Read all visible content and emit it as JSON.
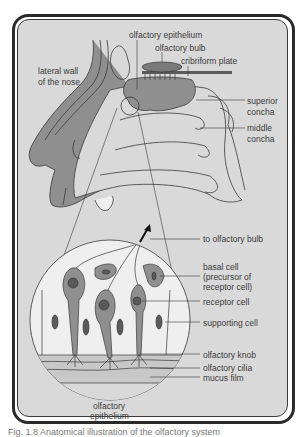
{
  "figure": {
    "frame_background": "#d9d9d9",
    "tissue_color": "#8f8f8f",
    "light_tissue_color": "#efefef",
    "line_color": "#3a3a3a",
    "caption": "Fig. 1.8 Anatomical illustration of the olfactory system"
  },
  "labels": {
    "olfactory_epithelium_top": "olfactory epithelium",
    "olfactory_bulb": "olfactory bulb",
    "cribriform_plate": "cribriform plate",
    "lateral_wall_line1": "lateral wall",
    "lateral_wall_line2": "of the nose",
    "superior_concha_line1": "superior",
    "superior_concha_line2": "concha",
    "middle_concha_line1": "middle",
    "middle_concha_line2": "concha",
    "to_olfactory_bulb": "to olfactory bulb",
    "basal_cell_line1": "basal cell",
    "basal_cell_line2": "(precursor of",
    "basal_cell_line3": "receptor cell)",
    "receptor_cell": "receptor cell",
    "supporting_cell": "supporting cell",
    "olfactory_knob": "olfactory knob",
    "olfactory_cilia": "olfactory cilia",
    "mucus_film": "mucus film",
    "olfactory_epithelium_bottom_line1": "olfactory",
    "olfactory_epithelium_bottom_line2": "epithelium"
  }
}
